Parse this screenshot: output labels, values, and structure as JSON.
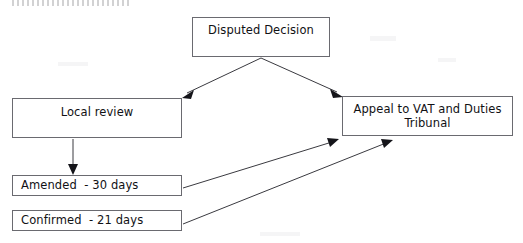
{
  "diagram": {
    "type": "flowchart",
    "background_color": "#ffffff",
    "box_border_color": "#6a6a70",
    "connector_color": "#3a3a40",
    "arrowhead_color": "#15151a",
    "top_artefact_note": "clipped line of text at the very top edge, illegible",
    "nodes": [
      {
        "id": "disputed-decision",
        "label": "Disputed Decision",
        "shape": "rectangle",
        "x": 192,
        "y": 17,
        "width": 138,
        "height": 40
      },
      {
        "id": "local-review",
        "label": "Local review",
        "shape": "rectangle",
        "x": 12,
        "y": 98,
        "width": 170,
        "height": 40
      },
      {
        "id": "appeal-tribunal",
        "label": "Appeal to VAT and Duties\nTribunal",
        "line_1": "Appeal to VAT and Duties",
        "line_2": "Tribunal",
        "shape": "rectangle",
        "x": 342,
        "y": 96,
        "width": 171,
        "height": 40
      },
      {
        "id": "amended",
        "label": "Amended  - 30 days",
        "shape": "rectangle",
        "x": 12,
        "y": 175,
        "width": 170,
        "height": 21
      },
      {
        "id": "confirmed",
        "label": "Confirmed  - 21 days",
        "shape": "rectangle",
        "x": 12,
        "y": 210,
        "width": 170,
        "height": 21
      }
    ],
    "edges": [
      {
        "id": "decision-to-local-review",
        "from": "disputed-decision",
        "to": "local-review",
        "style": "solid",
        "arrowhead": "filled-triangle"
      },
      {
        "id": "decision-to-tribunal",
        "from": "disputed-decision",
        "to": "appeal-tribunal",
        "style": "solid",
        "arrowhead": "filled-triangle"
      },
      {
        "id": "local-review-to-amended",
        "from": "local-review",
        "to": "amended",
        "style": "solid",
        "arrowhead": "filled-triangle"
      },
      {
        "id": "amended-to-tribunal",
        "from": "amended",
        "to": "appeal-tribunal",
        "style": "solid",
        "arrowhead": "filled-triangle"
      },
      {
        "id": "confirmed-to-tribunal",
        "from": "confirmed",
        "to": "appeal-tribunal",
        "style": "solid",
        "arrowhead": "filled-triangle"
      }
    ]
  }
}
